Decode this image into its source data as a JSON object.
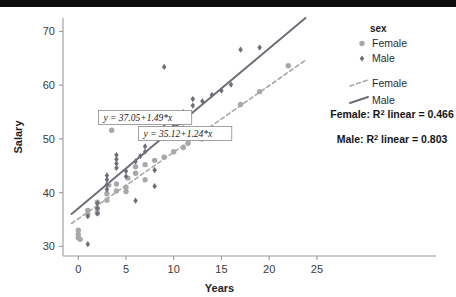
{
  "chart_data": {
    "type": "scatter",
    "title": "",
    "xlabel": "Years",
    "ylabel": "Salary",
    "xlim": [
      -1.6,
      27
    ],
    "ylim": [
      28.2,
      72.5
    ],
    "xticks": [
      "0",
      "5",
      "10",
      "15",
      "20",
      "25"
    ],
    "xtick_values": [
      0,
      5,
      10,
      15,
      20,
      25
    ],
    "yticks": [
      "30",
      "40",
      "50",
      "60",
      "70"
    ],
    "ytick_values": [
      30,
      40,
      50,
      60,
      70
    ],
    "grid": false,
    "legend_position": "right",
    "series": [
      {
        "name": "Female",
        "marker": "circle",
        "color": "#a8a8a8",
        "points": [
          [
            0.0,
            31.6
          ],
          [
            0.0,
            32.2
          ],
          [
            0.0,
            33.0
          ],
          [
            0.2,
            31.3
          ],
          [
            1.0,
            36.0
          ],
          [
            1.0,
            36.7
          ],
          [
            2.0,
            36.2
          ],
          [
            2.0,
            37.0
          ],
          [
            2.0,
            38.2
          ],
          [
            3.0,
            38.6
          ],
          [
            3.0,
            39.8
          ],
          [
            3.2,
            41.4
          ],
          [
            4.0,
            40.3
          ],
          [
            4.0,
            41.6
          ],
          [
            5.0,
            40.2
          ],
          [
            5.0,
            41.0
          ],
          [
            5.2,
            42.7
          ],
          [
            6.0,
            43.6
          ],
          [
            6.0,
            44.8
          ],
          [
            7.0,
            42.4
          ],
          [
            7.0,
            45.2
          ],
          [
            8.0,
            46.0
          ],
          [
            9.0,
            46.6
          ],
          [
            10.0,
            47.6
          ],
          [
            11.0,
            48.4
          ],
          [
            11.5,
            49.2
          ],
          [
            13.0,
            50.0
          ],
          [
            3.5,
            54.2
          ],
          [
            3.5,
            51.6
          ],
          [
            17.0,
            56.4
          ],
          [
            19.0,
            58.8
          ],
          [
            22.0,
            63.6
          ]
        ]
      },
      {
        "name": "Male",
        "marker": "diamond",
        "color": "#6e6e78",
        "points": [
          [
            1.0,
            30.4
          ],
          [
            1.0,
            35.6
          ],
          [
            2.0,
            36.1
          ],
          [
            2.0,
            37.1
          ],
          [
            2.0,
            38.0
          ],
          [
            3.0,
            40.6
          ],
          [
            3.0,
            41.5
          ],
          [
            3.0,
            42.4
          ],
          [
            3.0,
            43.2
          ],
          [
            4.0,
            44.6
          ],
          [
            4.0,
            45.4
          ],
          [
            4.0,
            46.2
          ],
          [
            4.0,
            47.0
          ],
          [
            5.0,
            43.0
          ],
          [
            5.0,
            44.0
          ],
          [
            6.0,
            45.8
          ],
          [
            6.5,
            46.8
          ],
          [
            7.0,
            47.6
          ],
          [
            7.0,
            48.6
          ],
          [
            8.0,
            51.6
          ],
          [
            9.0,
            51.4
          ],
          [
            9.0,
            52.2
          ],
          [
            10.0,
            51.8
          ],
          [
            10.0,
            52.6
          ],
          [
            11.0,
            52.0
          ],
          [
            11.0,
            55.0
          ],
          [
            12.0,
            56.2
          ],
          [
            12.0,
            57.4
          ],
          [
            13.0,
            57.0
          ],
          [
            14.0,
            58.2
          ],
          [
            15.0,
            59.0
          ],
          [
            16.0,
            60.1
          ],
          [
            17.0,
            66.6
          ],
          [
            19.0,
            67.0
          ],
          [
            9.0,
            63.4
          ],
          [
            6.0,
            38.5
          ],
          [
            8.0,
            41.2
          ],
          [
            8.0,
            44.2
          ]
        ]
      }
    ],
    "fit_lines": [
      {
        "name": "Female",
        "style": "dashed",
        "color": "#a8a8a8",
        "equation": "y = 35.12+1.24*x",
        "intercept": 35.12,
        "slope": 1.24,
        "r2_label": "Female: R",
        "r2_sup": "2",
        "r2_value": " linear = 0.466"
      },
      {
        "name": "Male",
        "style": "solid",
        "color": "#6e6e78",
        "equation": "y = 37.05+1.49*x",
        "intercept": 37.05,
        "slope": 1.49,
        "r2_label": "Male: R",
        "r2_sup": "2",
        "r2_value": " linear = 0.803"
      }
    ],
    "annotations": [
      {
        "text": "y = 37.05+1.49*x",
        "x": 7.0,
        "y": 54.0
      },
      {
        "text": "y = 35.12+1.24*x",
        "x": 11.2,
        "y": 51.0
      }
    ]
  },
  "legend": {
    "title": "sex",
    "marker_items": [
      {
        "label": "Female",
        "marker": "circle",
        "color": "#a8a8a8"
      },
      {
        "label": "Male",
        "marker": "diamond",
        "color": "#6e6e78"
      }
    ],
    "line_items": [
      {
        "label": "Female",
        "style": "dashed",
        "color": "#a8a8a8"
      },
      {
        "label": "Male",
        "style": "solid",
        "color": "#6e6e78"
      }
    ]
  },
  "stats": {
    "female_r2_prefix": "Female: R",
    "female_r2_sup": "2",
    "female_r2_suffix": " linear = 0.466",
    "male_r2_prefix": "Male: R",
    "male_r2_sup": "2",
    "male_r2_suffix": " linear = 0.803"
  },
  "axes": {
    "x_title": "Years",
    "y_title": "Salary"
  },
  "colors": {
    "female": "#a8a8a8",
    "male": "#6e6e78",
    "axis": "#9a9a9a",
    "text": "#1f1f1f",
    "top_band": "#0d0d0d"
  }
}
